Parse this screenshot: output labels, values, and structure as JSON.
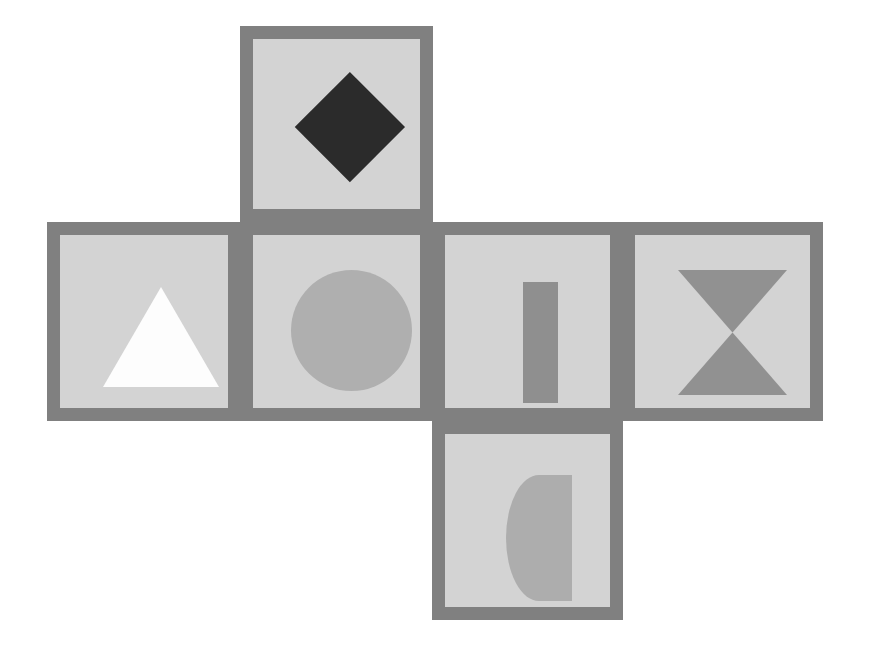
{
  "figure": {
    "width": 870,
    "height": 656,
    "background_color": "#ffffff",
    "panel_background_color": "#d3d3d3",
    "panel_frame_color": "#808080",
    "panel_frame_width": 13,
    "layout": "cross / cube-net: one top panel, a row of four middle panels, one bottom panel"
  },
  "panels": [
    {
      "id": "top",
      "name": "panel-diamond",
      "shape_name": "diamond",
      "shape_label": "Diamond",
      "shape_color": "#2b2b2b",
      "position": {
        "left": 240,
        "top": 26,
        "width": 193,
        "height": 196
      },
      "shape_box": {
        "left": 42,
        "top": 33,
        "width": 110,
        "height": 110
      },
      "grid_cell": "row 0, column 1"
    },
    {
      "id": "middle-1",
      "name": "panel-triangle",
      "shape_name": "triangle-up",
      "shape_label": "Triangle",
      "shape_color": "#fdfdfd",
      "position": {
        "left": 47,
        "top": 222,
        "width": 194,
        "height": 199
      },
      "shape_box": {
        "left": 43,
        "top": 52,
        "width": 116,
        "height": 100
      },
      "grid_cell": "row 1, column 0"
    },
    {
      "id": "middle-2",
      "name": "panel-circle",
      "shape_name": "circle",
      "shape_label": "Circle",
      "shape_color": "#afafaf",
      "position": {
        "left": 240,
        "top": 222,
        "width": 193,
        "height": 199
      },
      "shape_box": {
        "left": 38,
        "top": 35,
        "width": 121,
        "height": 121
      },
      "grid_cell": "row 1, column 1"
    },
    {
      "id": "middle-3",
      "name": "panel-bar",
      "shape_name": "rectangle-vertical",
      "shape_label": "Vertical bar",
      "shape_color": "#8f8f8f",
      "position": {
        "left": 432,
        "top": 222,
        "width": 191,
        "height": 199
      },
      "shape_box": {
        "left": 78,
        "top": 47,
        "width": 35,
        "height": 121
      },
      "grid_cell": "row 1, column 2"
    },
    {
      "id": "middle-4",
      "name": "panel-hourglass",
      "shape_name": "hourglass",
      "shape_label": "Hourglass",
      "shape_color": "#919191",
      "position": {
        "left": 622,
        "top": 222,
        "width": 201,
        "height": 199
      },
      "shape_box": {
        "left": 43,
        "top": 35,
        "width": 109,
        "height": 125
      },
      "grid_cell": "row 1, column 3"
    },
    {
      "id": "bottom",
      "name": "panel-semicircle",
      "shape_name": "semicircle-left",
      "shape_label": "Half disc",
      "shape_color": "#adadad",
      "position": {
        "left": 432,
        "top": 421,
        "width": 191,
        "height": 199
      },
      "shape_box": {
        "left": 61,
        "top": 41,
        "width": 66,
        "height": 126
      },
      "grid_cell": "row 2, column 2"
    }
  ]
}
